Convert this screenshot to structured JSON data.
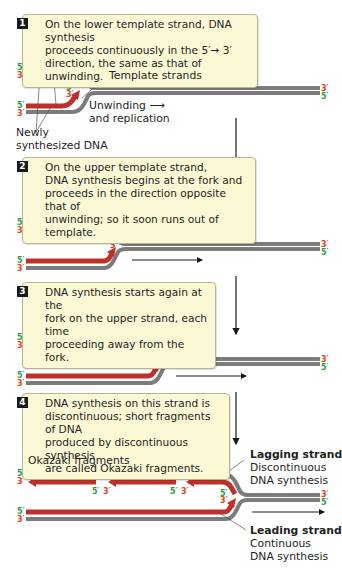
{
  "colors": {
    "template_strand": "#7b7b7b",
    "new_strand": "#c0302a",
    "callout_bg": "#fbf8d6",
    "callout_border": "#b9b58f",
    "five_prime_label": "#2f9a4a",
    "three_prime_label": "#d34a23"
  },
  "steps": [
    {
      "number": "1",
      "text_lines": [
        "On the lower template strand, DNA synthesis",
        "proceeds continuously in the 5′→ 3′",
        "direction, the same as that of unwinding."
      ]
    },
    {
      "number": "2",
      "text_lines": [
        "On the upper template strand,",
        "DNA synthesis begins at the fork and",
        "proceeds in the direction opposite that of",
        "unwinding; so it soon runs out of template."
      ]
    },
    {
      "number": "3",
      "text_lines": [
        "DNA synthesis starts again at the",
        "fork on the upper strand, each time",
        "proceeding away from the fork."
      ]
    },
    {
      "number": "4",
      "text_lines": [
        "DNA synthesis on this strand is",
        "discontinuous; short fragments of DNA",
        "produced by discontinuous synthesis",
        "are called Okazaki fragments."
      ]
    }
  ],
  "labels": {
    "template_strands": "Template strands",
    "unwinding_1": "Unwinding ⟶",
    "unwinding_2": "and replication",
    "newly_1": "Newly",
    "newly_2": "synthesized DNA",
    "okazaki": "Okazaki fragments",
    "lagging_title": "Lagging strand",
    "lagging_1": "Discontinuous",
    "lagging_2": "DNA synthesis",
    "leading_title": "Leading strand",
    "leading_1": "Continuous",
    "leading_2": "DNA synthesis"
  },
  "end_labels": {
    "five": "5′",
    "three": "3′"
  }
}
